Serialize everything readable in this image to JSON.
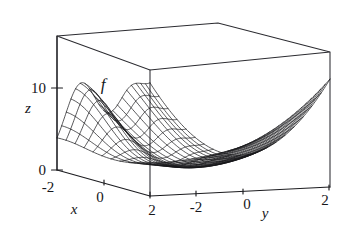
{
  "figure": {
    "kind": "3d-surface-wireframe-plot",
    "background_color": "#ffffff",
    "line_color": "#17171b",
    "box_color": "#2b2b30"
  },
  "labels": {
    "function": "f",
    "x_axis": "x",
    "y_axis": "y",
    "z_axis": "z"
  },
  "ticks": {
    "x": [
      "-2",
      "0",
      "2"
    ],
    "y": [
      "-2",
      "0",
      "2"
    ],
    "z": [
      "0",
      "10"
    ]
  },
  "chart_data": {
    "type": "line",
    "title": "",
    "subtitle": "",
    "xlabel": "x",
    "ylabel": "y",
    "zlabel": "z",
    "plot_kind": "surface",
    "render_style": "wireframe-mesh",
    "grid": false,
    "legend": null,
    "annotations": [
      {
        "text": "f",
        "meaning": "surface-name",
        "x": -0.6,
        "y": -1.6,
        "z": 9.0
      }
    ],
    "xlim": [
      -2,
      2
    ],
    "ylim": [
      -2,
      2
    ],
    "zlim": [
      0,
      14
    ],
    "xticks": [
      -2,
      0,
      2
    ],
    "yticks": [
      -2,
      0,
      2
    ],
    "zticks": [
      0,
      10
    ],
    "mesh_lines_x": 21,
    "mesh_lines_y": 21,
    "series": [
      {
        "name": "f(x,y)",
        "description": "Surface with a local hump near (x=-1, y=-2) rising to about z=7, a saddle/valley channel running across the middle near z=0, and steeply rising walls toward y=-2 at x=+2 and toward y=+2 at x=+2.",
        "x": [
          -2,
          -1.8,
          -1.6,
          -1.4,
          -1.2,
          -1,
          -0.8,
          -0.6,
          -0.4,
          -0.2,
          0,
          0.2,
          0.4,
          0.6,
          0.8,
          1,
          1.2,
          1.4,
          1.6,
          1.8,
          2
        ],
        "y": [
          -2,
          -1.8,
          -1.6,
          -1.4,
          -1.2,
          -1,
          -0.8,
          -0.6,
          -0.4,
          -0.2,
          0,
          0.2,
          0.4,
          0.6,
          0.8,
          1,
          1.2,
          1.4,
          1.6,
          1.8,
          2
        ],
        "z_samples": [
          {
            "x": -2,
            "y": -2,
            "z": 1.2
          },
          {
            "x": -1,
            "y": -2,
            "z": 6.8
          },
          {
            "x": 0,
            "y": -2,
            "z": 3.2
          },
          {
            "x": 1,
            "y": -2,
            "z": 7.0
          },
          {
            "x": 2,
            "y": -2,
            "z": 14.0
          },
          {
            "x": -2,
            "y": 0,
            "z": 0.6
          },
          {
            "x": 0,
            "y": 0,
            "z": 0.2
          },
          {
            "x": 2,
            "y": 0,
            "z": 4.5
          },
          {
            "x": -2,
            "y": 2,
            "z": 1.0
          },
          {
            "x": 0,
            "y": 2,
            "z": 1.6
          },
          {
            "x": 2,
            "y": 2,
            "z": 13.5
          }
        ]
      }
    ]
  }
}
